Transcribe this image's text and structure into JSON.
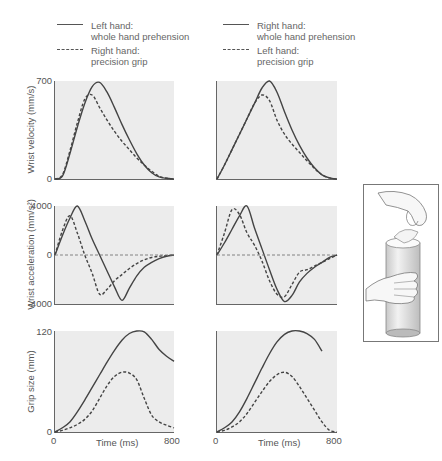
{
  "legend_left": {
    "solid_label_1": "Left hand:",
    "solid_label_2": "whole hand prehension",
    "dashed_label_1": "Right hand:",
    "dashed_label_2": "precision grip"
  },
  "legend_right": {
    "solid_label_1": "Right hand:",
    "solid_label_2": "whole hand prehension",
    "dashed_label_1": "Left hand:",
    "dashed_label_2": "precision grip"
  },
  "axes": {
    "velocity_label": "Wrist velocity (mm/s)",
    "acceleration_label": "Wrist acceleration (mm/s²)",
    "grip_label": "Grip size (mm)",
    "time_label": "Time (ms)",
    "velocity_ticks": [
      "700",
      "0"
    ],
    "acceleration_ticks": [
      "4000",
      "0",
      "-4000"
    ],
    "grip_ticks": [
      "120",
      "0"
    ],
    "time_ticks": [
      "0",
      "800"
    ]
  },
  "inset": {
    "description": "hands grasping cylinder illustration"
  },
  "chart_data": [
    {
      "type": "line",
      "title": "Left column: Wrist velocity",
      "xlabel": "Time (ms)",
      "ylabel": "Wrist velocity (mm/s)",
      "xlim": [
        0,
        800
      ],
      "ylim": [
        0,
        700
      ],
      "x": [
        0,
        50,
        100,
        150,
        200,
        250,
        300,
        350,
        400,
        450,
        500,
        550,
        600,
        650,
        700,
        750,
        800
      ],
      "series": [
        {
          "name": "Left hand: whole hand prehension",
          "style": "solid",
          "values": [
            0,
            20,
            180,
            370,
            540,
            660,
            690,
            620,
            510,
            390,
            280,
            180,
            100,
            45,
            15,
            5,
            0
          ]
        },
        {
          "name": "Right hand: precision grip",
          "style": "dashed",
          "values": [
            0,
            30,
            200,
            400,
            570,
            600,
            510,
            420,
            340,
            270,
            210,
            150,
            100,
            55,
            20,
            5,
            0
          ]
        }
      ]
    },
    {
      "type": "line",
      "title": "Left column: Wrist acceleration",
      "xlabel": "Time (ms)",
      "ylabel": "Wrist acceleration (mm/s²)",
      "xlim": [
        0,
        800
      ],
      "ylim": [
        -4000,
        4000
      ],
      "x": [
        0,
        50,
        100,
        150,
        200,
        250,
        300,
        350,
        400,
        450,
        500,
        550,
        600,
        650,
        700,
        750,
        800
      ],
      "series": [
        {
          "name": "Left hand: whole hand prehension",
          "style": "solid",
          "values": [
            0,
            1600,
            3000,
            4000,
            2800,
            1300,
            0,
            -1300,
            -2600,
            -3700,
            -2700,
            -1700,
            -1000,
            -600,
            -300,
            -100,
            0
          ]
        },
        {
          "name": "Right hand: precision grip",
          "style": "dashed",
          "values": [
            0,
            2000,
            3200,
            1800,
            0,
            -1500,
            -3200,
            -2800,
            -2100,
            -1600,
            -1100,
            -700,
            -400,
            -200,
            -100,
            -50,
            0
          ]
        },
        {
          "name": "zero reference",
          "style": "dashed",
          "values": [
            0,
            0,
            0,
            0,
            0,
            0,
            0,
            0,
            0,
            0,
            0,
            0,
            0,
            0,
            0,
            0,
            0
          ]
        }
      ]
    },
    {
      "type": "line",
      "title": "Left column: Grip size",
      "xlabel": "Time (ms)",
      "ylabel": "Grip size (mm)",
      "xlim": [
        0,
        800
      ],
      "ylim": [
        0,
        120
      ],
      "x": [
        0,
        50,
        100,
        150,
        200,
        250,
        300,
        350,
        400,
        450,
        500,
        550,
        600,
        650,
        700,
        750,
        800
      ],
      "series": [
        {
          "name": "Left hand: whole hand prehension",
          "style": "solid",
          "values": [
            0,
            5,
            12,
            24,
            38,
            53,
            68,
            83,
            97,
            109,
            117,
            120,
            119,
            110,
            98,
            90,
            84
          ]
        },
        {
          "name": "Right hand: precision grip",
          "style": "dashed",
          "values": [
            0,
            2,
            5,
            9,
            15,
            25,
            40,
            55,
            66,
            71,
            70,
            62,
            40,
            20,
            12,
            8,
            5
          ]
        }
      ]
    },
    {
      "type": "line",
      "title": "Right column: Wrist velocity",
      "xlabel": "Time (ms)",
      "ylabel": "Wrist velocity (mm/s)",
      "xlim": [
        0,
        800
      ],
      "ylim": [
        0,
        700
      ],
      "x": [
        0,
        50,
        100,
        150,
        200,
        250,
        300,
        350,
        400,
        450,
        500,
        550,
        600,
        650,
        700,
        750,
        800
      ],
      "series": [
        {
          "name": "Right hand: whole hand prehension",
          "style": "solid",
          "values": [
            0,
            100,
            210,
            320,
            430,
            540,
            650,
            700,
            620,
            480,
            350,
            240,
            150,
            80,
            30,
            8,
            0
          ]
        },
        {
          "name": "Left hand: precision grip",
          "style": "dashed",
          "values": [
            0,
            100,
            210,
            320,
            430,
            540,
            600,
            560,
            420,
            320,
            250,
            190,
            130,
            75,
            30,
            8,
            0
          ]
        }
      ]
    },
    {
      "type": "line",
      "title": "Right column: Wrist acceleration",
      "xlabel": "Time (ms)",
      "ylabel": "Wrist acceleration (mm/s²)",
      "xlim": [
        0,
        800
      ],
      "ylim": [
        -4000,
        4000
      ],
      "x": [
        0,
        50,
        100,
        150,
        200,
        250,
        300,
        350,
        400,
        450,
        500,
        550,
        600,
        650,
        700,
        750,
        800
      ],
      "series": [
        {
          "name": "Right hand: whole hand prehension",
          "style": "solid",
          "values": [
            0,
            1000,
            2100,
            3200,
            4000,
            2200,
            500,
            -1200,
            -2800,
            -3800,
            -3300,
            -2200,
            -1500,
            -1000,
            -600,
            -200,
            0
          ]
        },
        {
          "name": "Left hand: precision grip",
          "style": "dashed",
          "values": [
            0,
            1800,
            3700,
            3300,
            1800,
            800,
            -500,
            -2100,
            -3200,
            -3400,
            -2400,
            -1400,
            -1200,
            -900,
            -600,
            -300,
            0
          ]
        },
        {
          "name": "zero reference",
          "style": "dashed",
          "values": [
            0,
            0,
            0,
            0,
            0,
            0,
            0,
            0,
            0,
            0,
            0,
            0,
            0,
            0,
            0,
            0,
            0
          ]
        }
      ]
    },
    {
      "type": "line",
      "title": "Right column: Grip size",
      "xlabel": "Time (ms)",
      "ylabel": "Grip size (mm)",
      "xlim": [
        0,
        800
      ],
      "ylim": [
        0,
        120
      ],
      "x": [
        0,
        50,
        100,
        150,
        200,
        250,
        300,
        350,
        400,
        450,
        500,
        550,
        600,
        650,
        700,
        750,
        800
      ],
      "series": [
        {
          "name": "Right hand: whole hand prehension",
          "style": "solid",
          "values": [
            0,
            5,
            12,
            24,
            40,
            58,
            76,
            93,
            107,
            116,
            120,
            120,
            117,
            110,
            96,
            null,
            null
          ]
        },
        {
          "name": "Left hand: precision grip",
          "style": "dashed",
          "values": [
            0,
            2,
            6,
            12,
            22,
            35,
            48,
            60,
            68,
            71,
            66,
            54,
            40,
            26,
            12,
            2,
            0
          ]
        }
      ]
    }
  ]
}
